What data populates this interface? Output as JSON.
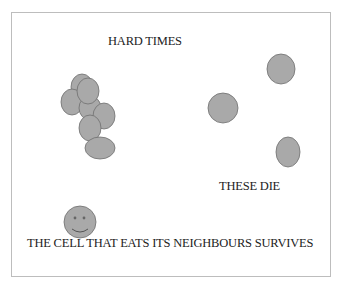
{
  "diagram": {
    "title": "HARD TIMES",
    "dying_label": "THESE DIE",
    "survivor_label": "THE CELL THAT EATS ITS NEIGHBOURS SURVIVES",
    "colors": {
      "cell_fill": "#a9a9a9",
      "cell_stroke": "#6f6f6f",
      "frame_border": "#bdbdbd",
      "text": "#222222"
    },
    "cluster_cells": [
      {
        "cx": 82,
        "cy": 87,
        "rx": 11,
        "ry": 13
      },
      {
        "cx": 72,
        "cy": 102,
        "rx": 11,
        "ry": 13
      },
      {
        "cx": 90,
        "cy": 108,
        "rx": 11,
        "ry": 12
      },
      {
        "cx": 88,
        "cy": 91,
        "rx": 11,
        "ry": 13
      },
      {
        "cx": 104,
        "cy": 116,
        "rx": 11,
        "ry": 13
      },
      {
        "cx": 90,
        "cy": 128,
        "rx": 11,
        "ry": 13
      },
      {
        "cx": 100,
        "cy": 148,
        "rx": 15,
        "ry": 11
      }
    ],
    "dying_cells": [
      {
        "cx": 281,
        "cy": 69,
        "rx": 14,
        "ry": 15
      },
      {
        "cx": 223,
        "cy": 108,
        "rx": 15,
        "ry": 15
      },
      {
        "cx": 288,
        "cy": 152,
        "rx": 12,
        "ry": 15
      }
    ],
    "survivor_cell": {
      "cx": 80,
      "cy": 222,
      "r": 16
    }
  }
}
